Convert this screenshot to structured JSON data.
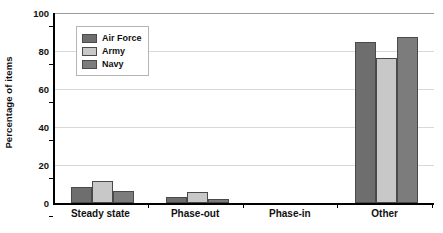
{
  "chart_data": {
    "type": "bar",
    "title": "",
    "xlabel": "",
    "ylabel": "Percentage of items",
    "categories": [
      "Steady state",
      "Phase-out",
      "Phase-in",
      "Other"
    ],
    "series": [
      {
        "name": "Air Force",
        "color": "#6e6e6e",
        "values": [
          8.5,
          3,
          0,
          84.5
        ]
      },
      {
        "name": "Army",
        "color": "#c8c8c8",
        "values": [
          11.5,
          6,
          0,
          76.5
        ]
      },
      {
        "name": "Navy",
        "color": "#7c7c7c",
        "values": [
          6.5,
          2,
          0,
          87.5
        ]
      }
    ],
    "ylim": [
      0,
      100
    ],
    "yticks": [
      0,
      20,
      40,
      60,
      80,
      100
    ],
    "ytick_labels": [
      "0",
      "20",
      "40",
      "60",
      "80",
      "100"
    ],
    "grid": true,
    "legend_position": "upper left"
  },
  "axis": {
    "y_title": "Percentage of items"
  },
  "legend": {
    "entries": [
      {
        "label": "Air Force"
      },
      {
        "label": "Army"
      },
      {
        "label": "Navy"
      }
    ]
  }
}
